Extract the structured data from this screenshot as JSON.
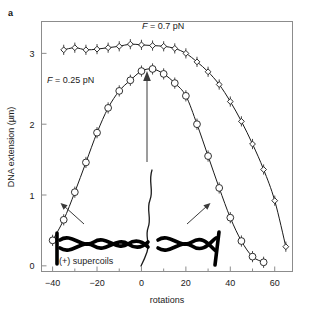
{
  "figure": {
    "panel_label": "a"
  },
  "chart_data": {
    "type": "line",
    "title": "",
    "xlabel": "rotations",
    "ylabel": "DNA extension (µm)",
    "xlim": [
      -45,
      68
    ],
    "ylim": [
      -0.08,
      3.45
    ],
    "xticks": [
      -40,
      -20,
      0,
      20,
      40,
      60
    ],
    "xtick_labels": [
      "−40",
      "−20",
      "0",
      "20",
      "40",
      "60"
    ],
    "xticks_minor": [
      -30,
      -10,
      10,
      30,
      50
    ],
    "yticks": [
      0,
      1,
      2,
      3
    ],
    "ytick_labels": [
      "0",
      "1",
      "2",
      "3"
    ],
    "grid": false,
    "legend_position": "inline-annotations",
    "series": [
      {
        "name": "F = 0.7 pN",
        "marker": "open-diamond",
        "x": [
          -35,
          -30,
          -25,
          -20,
          -15,
          -10,
          -5,
          0,
          5,
          10,
          15,
          20,
          25,
          30,
          35,
          40,
          45,
          50,
          55,
          60,
          65
        ],
        "y": [
          3.05,
          3.08,
          3.05,
          3.06,
          3.08,
          3.1,
          3.13,
          3.12,
          3.11,
          3.1,
          3.07,
          3.0,
          2.88,
          2.74,
          2.56,
          2.32,
          2.04,
          1.72,
          1.36,
          0.92,
          0.27
        ]
      },
      {
        "name": "F = 0.25 pN",
        "marker": "open-circle",
        "x": [
          -40,
          -35,
          -30,
          -25,
          -20,
          -15,
          -10,
          -5,
          0,
          5,
          10,
          15,
          20,
          25,
          30,
          35,
          40,
          45,
          50,
          55
        ],
        "y": [
          0.36,
          0.65,
          1.04,
          1.46,
          1.88,
          2.23,
          2.47,
          2.62,
          2.75,
          2.78,
          2.71,
          2.58,
          2.4,
          2.0,
          1.55,
          1.1,
          0.68,
          0.35,
          0.13,
          0.05
        ]
      }
    ],
    "annotations": [
      {
        "name": "force-label-high",
        "text": "F = 0.7 pN",
        "italic_prefix": "F",
        "rest": " = 0.7 pN",
        "x": 10,
        "y": 3.32
      },
      {
        "name": "force-label-low",
        "text": "F = 0.25 pN",
        "italic_prefix": "F",
        "rest": " = 0.25 pN",
        "x": -29,
        "y": 2.5
      },
      {
        "name": "negative-supercoils-label",
        "text": "(−) supercoils",
        "x": -22,
        "y": 0.18
      },
      {
        "name": "positive-supercoils-label",
        "text": "(+) supercoils",
        "x": 20,
        "y": 0.18
      },
      {
        "name": "peak-arrow",
        "text": "",
        "points_to_x": 0,
        "points_to_y": 2.78
      },
      {
        "name": "negative-supercoil-arrow",
        "text": ""
      },
      {
        "name": "positive-supercoil-arrow",
        "text": ""
      }
    ]
  },
  "colors": {
    "curve": "#1a1a1a",
    "frame": "#8c8c8c",
    "background": "#ffffff",
    "coil": "#000000",
    "pointer": "#3a3a3a"
  }
}
